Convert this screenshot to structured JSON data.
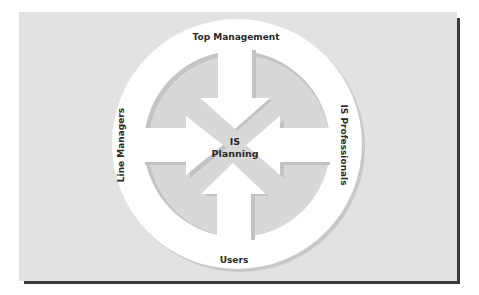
{
  "diagram": {
    "center_label_line1": "IS",
    "center_label_line2": "Planning",
    "labels": {
      "top": "Top Management",
      "right": "IS Professionals",
      "bottom": "Users",
      "left": "Line Managers"
    },
    "colors": {
      "panel": "#e2e2e2",
      "panel_shadow": "#3a3a3a",
      "ring": "#ffffff",
      "ring_shadow": "#c8c8c8",
      "inner_disc": "#d6d6d6",
      "arrow": "#ffffff",
      "text": "#2a2a2a"
    }
  }
}
